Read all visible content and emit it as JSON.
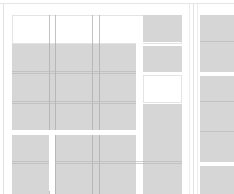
{
  "layout": {
    "left_grid": {
      "columns": 4,
      "header_row": [
        "blank",
        "blank",
        "blank",
        "filled"
      ],
      "rows": [
        [
          "filled",
          "filled",
          "filled",
          "filled"
        ],
        [
          "filled",
          "filled",
          "filled",
          "empty"
        ],
        [
          "filled",
          "filled",
          "filled",
          "filled"
        ],
        [
          "filled",
          "filled",
          "filled",
          "filled"
        ],
        [
          "filled",
          "filled",
          "filled",
          "filled"
        ]
      ]
    },
    "right_grid": {
      "columns": 1,
      "rows": [
        "filled",
        "filled",
        "filled"
      ]
    }
  },
  "colors": {
    "tile_fill": "#d6d6d6",
    "tile_empty": "#ffffff",
    "grid_line": "#b9b9b9",
    "panel_border": "#e2e2e2"
  }
}
